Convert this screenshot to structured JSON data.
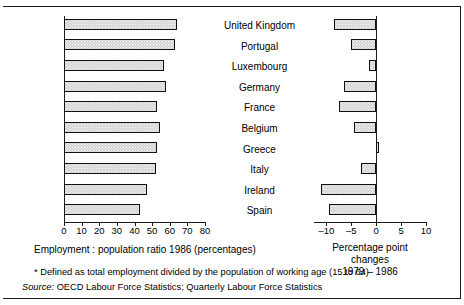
{
  "chart_data": {
    "type": "bar",
    "title": "",
    "orientation": "horizontal",
    "categories": [
      "United Kingdom",
      "Portugal",
      "Luxembourg",
      "Germany",
      "France",
      "Belgium",
      "Greece",
      "Italy",
      "Ireland",
      "Spain"
    ],
    "panels": [
      {
        "id": "employment-population-ratio",
        "xlabel": "Employment : population ratio 1986 (percentages)",
        "xlim": [
          0,
          80
        ],
        "xticks": [
          0,
          10,
          20,
          30,
          40,
          50,
          60,
          70,
          80
        ],
        "xtick_labels": [
          "0",
          "10",
          "20",
          "30",
          "40",
          "50",
          "60",
          "70",
          "80"
        ],
        "grid": false,
        "values": [
          64.0,
          63.0,
          57.0,
          58.0,
          53.0,
          54.5,
          53.0,
          52.0,
          47.0,
          43.0
        ]
      },
      {
        "id": "percentage-point-changes",
        "xlabel": "Percentage point changes 1979 – 1986",
        "xlim": [
          -12.5,
          10
        ],
        "xticks": [
          -10,
          -5,
          0,
          5,
          10
        ],
        "xtick_labels": [
          "–10",
          "–5",
          "0",
          "5",
          "10"
        ],
        "grid": false,
        "values": [
          -8.5,
          -5.0,
          -1.5,
          -6.5,
          -7.5,
          -4.5,
          0.6,
          -3.0,
          -11.0,
          -9.5
        ]
      }
    ],
    "legend": [],
    "annotations": []
  },
  "captions": {
    "left": "Employment : population ratio 1986 (percentages)",
    "right_line1": "Percentage point changes",
    "right_line2": "1979 – 1986"
  },
  "footnotes": {
    "definition": "* Defined as total employment divided by the population of working age (15 to 64)",
    "source_label": "Source:",
    "source_text": "OECD Labour Force Statistics; Quarterly Labour Force Statistics"
  },
  "colors": {
    "bar_fill": "#d4d4d4",
    "bar_border": "#101010",
    "axis": "#1a1a1a",
    "background": "#ffffff",
    "text": "#000000"
  }
}
